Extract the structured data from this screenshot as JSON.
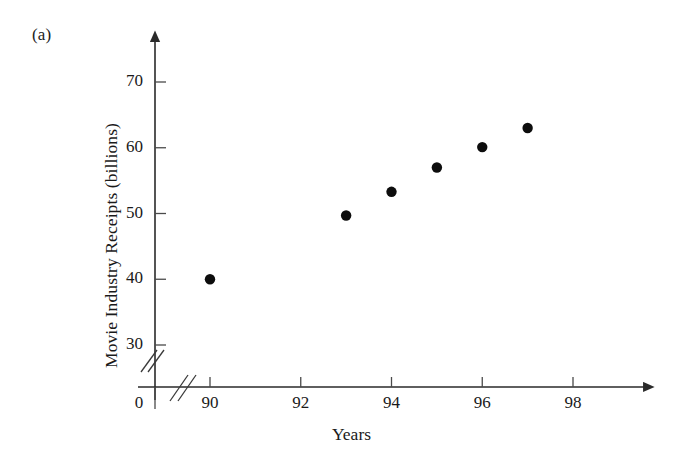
{
  "figure": {
    "panel_label": "(a)",
    "background_color": "#ffffff",
    "ink_color": "#1a1a1a"
  },
  "chart_data": {
    "type": "scatter",
    "title": "",
    "xlabel": "Years",
    "ylabel": "Movie Industry Receipts (billions)",
    "x": [
      90,
      93,
      94,
      95,
      96,
      97
    ],
    "values": [
      40.0,
      49.7,
      53.3,
      57.0,
      60.1,
      63.0
    ],
    "points": [
      {
        "x": 90,
        "y": 40.0
      },
      {
        "x": 93,
        "y": 49.7
      },
      {
        "x": 94,
        "y": 53.3
      },
      {
        "x": 95,
        "y": 57.0
      },
      {
        "x": 96,
        "y": 60.1
      },
      {
        "x": 97,
        "y": 63.0
      }
    ],
    "xticks": [
      90,
      92,
      94,
      96,
      98
    ],
    "xtick_labels": [
      "90",
      "92",
      "94",
      "96",
      "98"
    ],
    "yticks": [
      30,
      40,
      50,
      60,
      70
    ],
    "ytick_labels": [
      "30",
      "40",
      "50",
      "60",
      "70"
    ],
    "origin_label": "0",
    "xlim": [
      89.0,
      99.1
    ],
    "ylim": [
      26.0,
      74.0
    ],
    "grid": false,
    "legend": null,
    "axis_break_x": true,
    "axis_break_y": true,
    "marker": "filled-circle",
    "marker_color": "#0d0d0d"
  }
}
